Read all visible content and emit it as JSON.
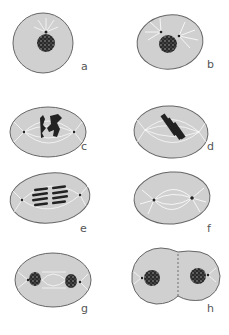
{
  "figure": {
    "colors": {
      "cell_fill": "#d0d0d0",
      "cell_stroke": "#666666",
      "chromatin": "#2a2a2a",
      "spindle": "#ffffff",
      "label": "#555555"
    },
    "panels": [
      {
        "id": "a",
        "label": "a",
        "description": "interphase cell with nucleus and centrosome"
      },
      {
        "id": "b",
        "label": "b",
        "description": "prophase, centrosomes separating with asters"
      },
      {
        "id": "c",
        "label": "c",
        "description": "prometaphase, condensed chromosomes and spindle"
      },
      {
        "id": "d",
        "label": "d",
        "description": "metaphase, chromosomes aligned at plate"
      },
      {
        "id": "e",
        "label": "e",
        "description": "anaphase, chromatids separating"
      },
      {
        "id": "f",
        "label": "f",
        "description": "late anaphase / spindle elongation"
      },
      {
        "id": "g",
        "label": "g",
        "description": "telophase, two nuclei forming"
      },
      {
        "id": "h",
        "label": "h",
        "description": "cytokinesis, two daughter cells"
      }
    ]
  }
}
